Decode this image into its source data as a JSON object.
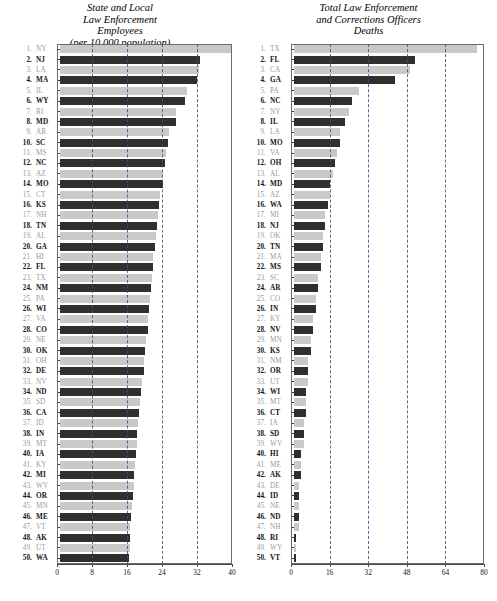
{
  "figure": {
    "background": "#ffffff",
    "bar_color_odd": "#c9c9c9",
    "bar_color_even": "#2f2f2f",
    "gridline_color": "#4a4a8c",
    "frame_color": "#6b6b6b"
  },
  "chart_data": [
    {
      "type": "bar",
      "orientation": "horizontal",
      "id": "state-and-local-law-enforcement-employees",
      "title": "State and Local\nLaw Enforcement\nEmployees\n(per 10,000 population)",
      "title_lines": [
        "State and Local",
        "Law Enforcement",
        "Employees",
        "(per 10,000 population)"
      ],
      "xlabel": "",
      "ylabel": "",
      "xlim": [
        0,
        40
      ],
      "xticks": [
        0,
        8,
        16,
        24,
        32,
        40
      ],
      "xtick_labels": [
        "0",
        "8",
        "16",
        "24",
        "32",
        "40"
      ],
      "grid": true,
      "grid_axis": "x",
      "legend": "none",
      "categories": [
        "NY",
        "NJ",
        "LA",
        "MA",
        "IL",
        "WY",
        "RI",
        "MD",
        "AR",
        "SC",
        "MS",
        "NC",
        "AZ",
        "MO",
        "CT",
        "KS",
        "NH",
        "TN",
        "AL",
        "GA",
        "HI",
        "FL",
        "TX",
        "NM",
        "PA",
        "WI",
        "VA",
        "CO",
        "NE",
        "OK",
        "OH",
        "DE",
        "NV",
        "ND",
        "SD",
        "CA",
        "ID",
        "IN",
        "MT",
        "IA",
        "KY",
        "MI",
        "WV",
        "OR",
        "MN",
        "ME",
        "VT",
        "AK",
        "UT",
        "WA"
      ],
      "ranks": [
        1,
        2,
        3,
        4,
        5,
        6,
        7,
        8,
        9,
        10,
        11,
        12,
        13,
        14,
        15,
        16,
        17,
        18,
        19,
        20,
        21,
        22,
        23,
        24,
        25,
        26,
        27,
        28,
        29,
        30,
        31,
        32,
        33,
        34,
        35,
        36,
        37,
        38,
        39,
        40,
        41,
        42,
        43,
        44,
        45,
        46,
        47,
        48,
        49,
        50
      ],
      "values": [
        39.4,
        32.1,
        31.8,
        31.3,
        29.1,
        28.5,
        26.6,
        26.4,
        24.8,
        24.6,
        24.3,
        24.1,
        23.6,
        23.5,
        22.9,
        22.7,
        22.3,
        22.2,
        21.9,
        21.7,
        21.3,
        21.2,
        21.0,
        20.8,
        20.6,
        20.4,
        20.2,
        20.0,
        19.7,
        19.4,
        19.3,
        19.1,
        18.8,
        18.6,
        18.3,
        18.1,
        17.9,
        17.7,
        17.5,
        17.3,
        17.1,
        16.9,
        16.8,
        16.6,
        16.4,
        16.2,
        16.1,
        16.0,
        15.9,
        15.8
      ]
    },
    {
      "type": "bar",
      "orientation": "horizontal",
      "id": "total-law-enforcement-and-corrections-officers-deaths",
      "title": "Total Law Enforcement\nand Corrections Officers\nDeaths",
      "title_lines": [
        "Total Law Enforcement",
        "and Corrections Officers",
        "Deaths"
      ],
      "xlabel": "",
      "ylabel": "",
      "xlim": [
        0,
        80
      ],
      "xticks": [
        0,
        16,
        32,
        48,
        64,
        80
      ],
      "xtick_labels": [
        "0",
        "16",
        "32",
        "48",
        "64",
        "80"
      ],
      "grid": true,
      "grid_axis": "x",
      "legend": "none",
      "categories": [
        "TX",
        "FL",
        "CA",
        "GA",
        "PA",
        "NC",
        "NY",
        "IL",
        "LA",
        "MO",
        "VA",
        "OH",
        "AL",
        "MD",
        "AZ",
        "WA",
        "MI",
        "NJ",
        "OK",
        "TN",
        "MA",
        "MS",
        "SC",
        "AR",
        "CO",
        "IN",
        "KY",
        "NV",
        "MN",
        "KS",
        "NM",
        "OR",
        "UT",
        "WI",
        "MT",
        "CT",
        "IA",
        "SD",
        "WV",
        "HI",
        "ME",
        "AK",
        "DE",
        "ID",
        "NE",
        "ND",
        "NH",
        "RI",
        "WY",
        "VT"
      ],
      "ranks": [
        1,
        2,
        3,
        4,
        5,
        6,
        7,
        8,
        9,
        10,
        11,
        12,
        13,
        14,
        15,
        16,
        17,
        18,
        19,
        20,
        21,
        22,
        23,
        24,
        25,
        26,
        27,
        28,
        29,
        30,
        31,
        32,
        33,
        34,
        35,
        36,
        37,
        38,
        39,
        40,
        41,
        42,
        43,
        44,
        45,
        46,
        47,
        48,
        49,
        50
      ],
      "values": [
        76,
        50,
        48,
        42,
        27,
        24,
        23,
        21,
        19,
        19,
        18,
        17,
        16,
        15,
        15,
        14,
        13,
        13,
        12,
        12,
        11,
        11,
        10,
        10,
        9,
        9,
        8,
        8,
        7,
        7,
        6,
        6,
        6,
        5,
        5,
        5,
        4,
        4,
        4,
        3,
        3,
        3,
        2,
        2,
        2,
        2,
        2,
        1,
        1,
        1
      ]
    }
  ]
}
